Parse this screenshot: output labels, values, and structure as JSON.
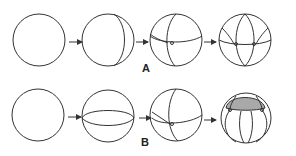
{
  "figure": {
    "rows": [
      {
        "label": "A",
        "stages": [
          "undivided sphere",
          "first meridional cleavage",
          "second cleavage with equatorial band",
          "four-cell symmetric division"
        ]
      },
      {
        "label": "B",
        "stages": [
          "undivided sphere",
          "equatorial cleavage",
          "meridional cleavage",
          "cap shaded division"
        ]
      }
    ],
    "colors": {
      "stroke": "#333333",
      "shade": "#a9a9a9",
      "background": "#ffffff"
    }
  }
}
